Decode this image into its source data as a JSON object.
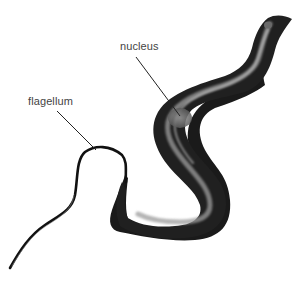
{
  "diagram": {
    "labels": [
      {
        "id": "nucleus",
        "text": "nucleus"
      },
      {
        "id": "flagellum",
        "text": "flagellum"
      }
    ],
    "colors": {
      "body_dark": "#111111",
      "body_mid": "#555555",
      "body_light": "#bbbbbb",
      "leader_line": "#222222",
      "label_text": "#444444",
      "background": "#ffffff"
    }
  }
}
